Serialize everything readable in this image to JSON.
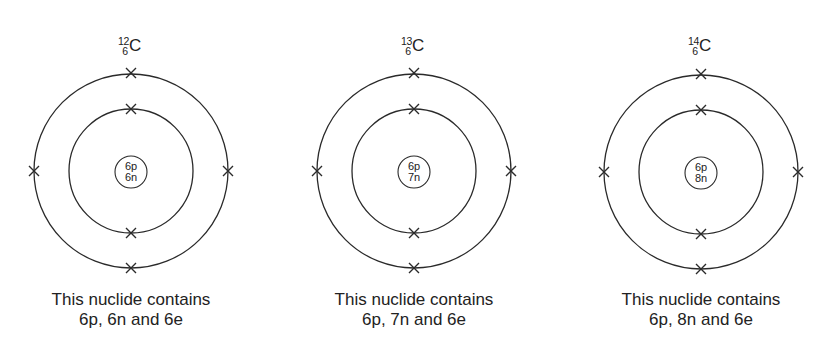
{
  "figure": {
    "colors": {
      "stroke": "#2a2a2a",
      "text": "#222222",
      "background": "#ffffff"
    },
    "atoms": [
      {
        "mass_number": "12",
        "atomic_number": "6",
        "element": "C",
        "nucleus": {
          "protons": "6p",
          "neutrons": "6n"
        },
        "shells": [
          {
            "name": "inner",
            "electrons": 2
          },
          {
            "name": "outer",
            "electrons": 4
          }
        ],
        "electron_marker": "×",
        "caption_line1": "This nuclide contains",
        "caption_line2": "6p, 6n and 6e"
      },
      {
        "mass_number": "13",
        "atomic_number": "6",
        "element": "C",
        "nucleus": {
          "protons": "6p",
          "neutrons": "7n"
        },
        "shells": [
          {
            "name": "inner",
            "electrons": 2
          },
          {
            "name": "outer",
            "electrons": 4
          }
        ],
        "electron_marker": "×",
        "caption_line1": "This nuclide contains",
        "caption_line2": "6p, 7n and 6e"
      },
      {
        "mass_number": "14",
        "atomic_number": "6",
        "element": "C",
        "nucleus": {
          "protons": "6p",
          "neutrons": "8n"
        },
        "shells": [
          {
            "name": "inner",
            "electrons": 2
          },
          {
            "name": "outer",
            "electrons": 4
          }
        ],
        "electron_marker": "×",
        "caption_line1": "This nuclide contains",
        "caption_line2": "6p, 8n and 6e"
      }
    ]
  }
}
